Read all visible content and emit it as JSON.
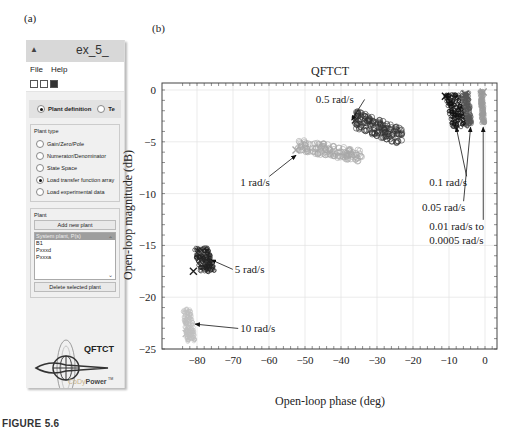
{
  "panels": {
    "a": "(a)",
    "b": "(b)"
  },
  "figure_caption": "FIGURE 5.6",
  "app": {
    "title": "ex_5_",
    "menu": [
      "File",
      "Help"
    ],
    "toolbar_icons": [
      "new-file-icon",
      "open-folder-icon",
      "save-icon"
    ],
    "tabs": [
      {
        "label": "Plant definition",
        "selected": true
      },
      {
        "label": "Te",
        "selected": false
      }
    ],
    "plant_type": {
      "title": "Plant type",
      "options": [
        {
          "label": "Gain/Zero/Pole",
          "selected": false
        },
        {
          "label": "Numerator/Denominator",
          "selected": false
        },
        {
          "label": "State Space",
          "selected": false
        },
        {
          "label": "Load transfer function array",
          "selected": true
        },
        {
          "label": "Load experimental data",
          "selected": false
        }
      ]
    },
    "plant": {
      "title": "Plant",
      "add_button": "Add new plant",
      "list": [
        "System plant, P(s)",
        "B1",
        "Pxxxd",
        "Pxxxa"
      ],
      "selected_index": 0,
      "delete_button": "Delete selected plant"
    },
    "logo": {
      "product": "QFTCT",
      "brand": "CoDyPower",
      "trademark": "TM",
      "edition": "Standard version"
    }
  },
  "chart_data": {
    "type": "scatter",
    "title": "QFTCT",
    "xlabel": "Open-loop phase (deg)",
    "ylabel": "Open-loop magnitude (dB)",
    "xlim": [
      -85,
      3
    ],
    "ylim": [
      -25,
      1
    ],
    "xticks": [
      -80,
      -70,
      -60,
      -50,
      -40,
      -30,
      -20,
      -10,
      0
    ],
    "yticks": [
      0,
      -5,
      -10,
      -15,
      -20,
      -25
    ],
    "grid": true,
    "marker": "circle templates with nominal plant marked by x",
    "series": [
      {
        "name": "0.0005-0.01 rad/s",
        "color": "#9a9a9a",
        "nominal": [
          -0.5,
          -0.2
        ],
        "phase_range": [
          -1.5,
          0
        ],
        "mag_range": [
          -3.2,
          -0.1
        ]
      },
      {
        "name": "0.05 rad/s",
        "color": "#555555",
        "nominal": [
          -5.5,
          -0.4
        ],
        "phase_range": [
          -6.5,
          -3.5
        ],
        "mag_range": [
          -3.5,
          -0.2
        ]
      },
      {
        "name": "0.1 rad/s",
        "color": "#111111",
        "nominal": [
          -11,
          -0.6
        ],
        "phase_range": [
          -11,
          -5.5
        ],
        "mag_range": [
          -3.6,
          -0.4
        ]
      },
      {
        "name": "0.5 rad/s",
        "color": "#333333",
        "nominal": [
          -36,
          -2.9
        ],
        "phase_range": [
          -36,
          -23
        ],
        "mag_range": [
          -5.3,
          -2.1
        ]
      },
      {
        "name": "1 rad/s",
        "color": "#a8a8a8",
        "nominal": [
          -52.5,
          -5.8
        ],
        "phase_range": [
          -52,
          -34
        ],
        "mag_range": [
          -6.9,
          -4.8
        ]
      },
      {
        "name": "5 rad/s",
        "color": "#222222",
        "nominal": [
          -81,
          -17.5
        ],
        "phase_range": [
          -81,
          -75
        ],
        "mag_range": [
          -17.6,
          -15.2
        ]
      },
      {
        "name": "10 rad/s",
        "color": "#c0c0c0",
        "nominal": [
          -83,
          -23.5
        ],
        "phase_range": [
          -84,
          -80.5
        ],
        "mag_range": [
          -24.3,
          -21.1
        ]
      }
    ],
    "annotations": [
      {
        "text": "0.5 rad/s",
        "x": -47,
        "y": -1.3,
        "arrow_to": [
          -37,
          -2.9
        ]
      },
      {
        "text": "1 rad/s",
        "x": -68,
        "y": -9.3,
        "arrow_to": [
          -52.5,
          -6.3
        ]
      },
      {
        "text": "0.1 rad/s",
        "x": -15.5,
        "y": -9.3,
        "arrow_to": [
          -8,
          -3.6
        ]
      },
      {
        "text": "0.05 rad/s",
        "x": -17.5,
        "y": -11.7,
        "arrow_to": [
          -4,
          -3.6
        ]
      },
      {
        "text": "0.01 rad/s to",
        "x": -15.5,
        "y": -13.5,
        "arrow_to": [
          -0.5,
          -3.6
        ]
      },
      {
        "text": "0.0005 rad/s",
        "x": -15.5,
        "y": -14.9,
        "arrow_to": null
      },
      {
        "text": "5 rad/s",
        "x": -69.5,
        "y": -17.7,
        "arrow_to": [
          -76,
          -16.4
        ]
      },
      {
        "text": "10 rad/s",
        "x": -68,
        "y": -23.4,
        "arrow_to": [
          -80.5,
          -22.6
        ]
      }
    ]
  }
}
